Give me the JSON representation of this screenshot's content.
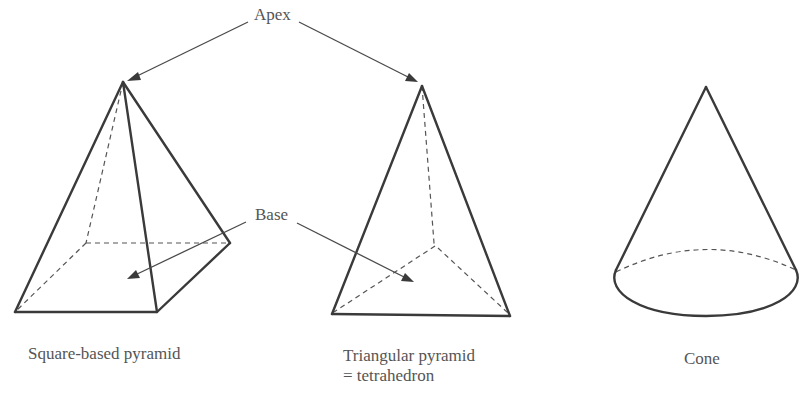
{
  "figure": {
    "callouts": {
      "apex": "Apex",
      "base": "Base"
    },
    "shapes": [
      {
        "id": "square-pyramid",
        "caption_line1": "Square-based pyramid",
        "caption_line2": ""
      },
      {
        "id": "triangular-pyramid",
        "caption_line1": "Triangular pyramid",
        "caption_line2": "= tetrahedron"
      },
      {
        "id": "cone",
        "caption_line1": "Cone",
        "caption_line2": ""
      }
    ],
    "colors": {
      "line": "#3a3a3a",
      "text": "#555555",
      "background": "#ffffff"
    }
  }
}
